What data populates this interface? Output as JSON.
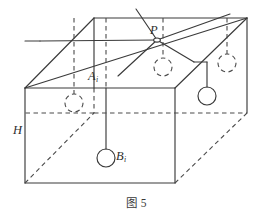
{
  "figure": {
    "caption": "图 5",
    "caption_label": "图",
    "caption_number": "5",
    "width": 273,
    "height": 216,
    "background_color": "#ffffff",
    "stroke_color": "#3a3a3a",
    "dashed_stroke_color": "#4a4a4a"
  },
  "labels": {
    "P": {
      "text": "P",
      "subscript": "",
      "x": 150,
      "y": 24
    },
    "A": {
      "text": "A",
      "subscript": "i",
      "x": 88,
      "y": 70
    },
    "B": {
      "text": "B",
      "subscript": "i",
      "x": 116,
      "y": 150
    },
    "H": {
      "text": "H",
      "subscript": "",
      "x": 13,
      "y": 124
    }
  },
  "geometry": {
    "description": "Rectangular cuboid drawn in oblique parallel projection with an interior apex point P on the top face and suspended circular nodes.",
    "box": {
      "front_top_left": [
        25,
        88
      ],
      "front_top_right": [
        175,
        88
      ],
      "front_bottom_left": [
        25,
        183
      ],
      "front_bottom_right": [
        175,
        183
      ],
      "back_top_left": [
        94,
        18
      ],
      "back_top_right": [
        247,
        18
      ],
      "back_bottom_left": [
        94,
        113
      ],
      "back_bottom_right": [
        247,
        113
      ],
      "depth_offset": [
        69,
        -70
      ]
    },
    "top_face_divider_line": {
      "from": [
        25,
        88
      ],
      "to": [
        247,
        18
      ]
    },
    "inner_ridge_line": {
      "from": [
        94,
        18
      ],
      "to": [
        94,
        113
      ]
    }
  },
  "apex": {
    "name": "P",
    "position": [
      157,
      40
    ],
    "rays": [
      {
        "to": [
          136,
          9
        ],
        "style": "solid"
      },
      {
        "to": [
          230,
          14
        ],
        "style": "solid"
      },
      {
        "to": [
          194,
          62
        ],
        "style": "solid"
      },
      {
        "to": [
          40,
          41
        ],
        "style": "solid"
      },
      {
        "to": [
          118,
          76
        ],
        "style": "solid"
      }
    ]
  },
  "nodes": [
    {
      "id": "node-front-left-dashed",
      "circle": [
        74,
        103
      ],
      "radius": 9,
      "circle_style": "dashed",
      "stem_from": [
        74,
        76
      ],
      "stem_to": [
        74,
        94
      ],
      "stem_style": "dashed"
    },
    {
      "id": "node-Bi-solid",
      "circle": [
        106,
        158
      ],
      "radius": 9,
      "circle_style": "solid",
      "stem_from": [
        106,
        88
      ],
      "stem_to": [
        106,
        149
      ],
      "stem_style": "solid"
    },
    {
      "id": "node-mid-dashed",
      "circle": [
        163,
        67
      ],
      "radius": 9,
      "circle_style": "dashed",
      "stem_from": [
        163,
        41
      ],
      "stem_to": [
        163,
        58
      ],
      "stem_style": "dashed"
    },
    {
      "id": "node-right-solid",
      "circle": [
        207,
        96
      ],
      "radius": 9,
      "circle_style": "solid",
      "stem_from": [
        207,
        62
      ],
      "stem_to": [
        207,
        87
      ],
      "stem_style": "solid"
    },
    {
      "id": "node-back-right-dashed",
      "circle": [
        227,
        63
      ],
      "radius": 9,
      "circle_style": "dashed",
      "stem_from": [
        227,
        22
      ],
      "stem_to": [
        227,
        54
      ],
      "stem_style": "dashed"
    }
  ],
  "vertical_guides": [
    {
      "from": [
        74,
        18
      ],
      "to": [
        74,
        88
      ],
      "style": "dashed"
    },
    {
      "from": [
        106,
        18
      ],
      "to": [
        106,
        88
      ],
      "style": "dashed"
    },
    {
      "from": [
        163,
        18
      ],
      "to": [
        163,
        41
      ],
      "style": "dashed"
    },
    {
      "from": [
        227,
        18
      ],
      "to": [
        227,
        40
      ],
      "style": "dashed"
    }
  ]
}
